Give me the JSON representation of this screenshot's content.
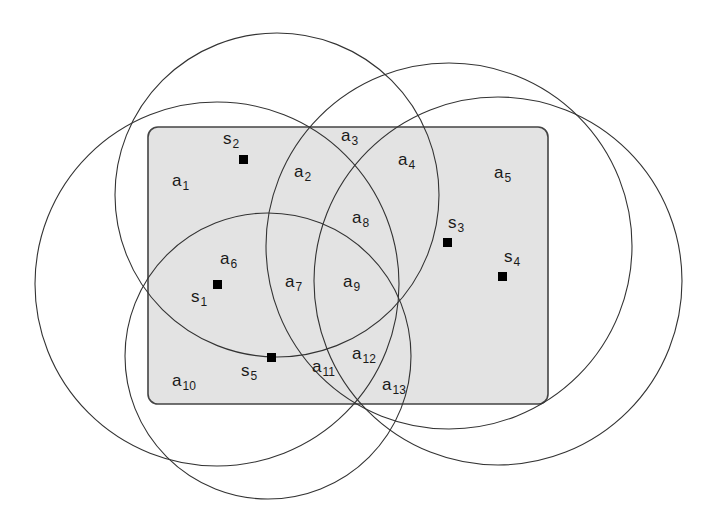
{
  "diagram": {
    "type": "sensor-coverage-venn",
    "colors": {
      "region_fill": "#e3e3e3",
      "region_border": "#444444",
      "circle_stroke": "#333333",
      "sensor_fill": "#000000",
      "label_text": "#1a1a1a"
    },
    "region": {
      "x": 148,
      "y": 127,
      "width": 400,
      "height": 277,
      "radius": 10
    },
    "circles": [
      {
        "id": "c1",
        "cx": 217,
        "cy": 284,
        "r": 182
      },
      {
        "id": "c2",
        "cx": 277,
        "cy": 195,
        "r": 162
      },
      {
        "id": "c3",
        "cx": 449,
        "cy": 246,
        "r": 183
      },
      {
        "id": "c4",
        "cx": 498,
        "cy": 281,
        "r": 184
      },
      {
        "id": "c5",
        "cx": 268,
        "cy": 356,
        "r": 143
      }
    ],
    "sensors": [
      {
        "id": "s1",
        "base": "s",
        "sub": "1",
        "x": 217,
        "y": 284,
        "label_x": 191,
        "label_y": 288
      },
      {
        "id": "s2",
        "base": "s",
        "sub": "2",
        "x": 243,
        "y": 159,
        "label_x": 223,
        "label_y": 130
      },
      {
        "id": "s3",
        "base": "s",
        "sub": "3",
        "x": 447,
        "y": 242,
        "label_x": 448,
        "label_y": 214
      },
      {
        "id": "s4",
        "base": "s",
        "sub": "4",
        "x": 502,
        "y": 276,
        "label_x": 504,
        "label_y": 248
      },
      {
        "id": "s5",
        "base": "s",
        "sub": "5",
        "x": 271,
        "y": 357,
        "label_x": 241,
        "label_y": 362
      }
    ],
    "areas": [
      {
        "id": "a1",
        "base": "a",
        "sub": "1",
        "x": 172,
        "y": 172
      },
      {
        "id": "a2",
        "base": "a",
        "sub": "2",
        "x": 294,
        "y": 163
      },
      {
        "id": "a3",
        "base": "a",
        "sub": "3",
        "x": 341,
        "y": 127
      },
      {
        "id": "a4",
        "base": "a",
        "sub": "4",
        "x": 398,
        "y": 151
      },
      {
        "id": "a5",
        "base": "a",
        "sub": "5",
        "x": 494,
        "y": 164
      },
      {
        "id": "a6",
        "base": "a",
        "sub": "6",
        "x": 220,
        "y": 250
      },
      {
        "id": "a7",
        "base": "a",
        "sub": "7",
        "x": 285,
        "y": 273
      },
      {
        "id": "a8",
        "base": "a",
        "sub": "8",
        "x": 352,
        "y": 209
      },
      {
        "id": "a9",
        "base": "a",
        "sub": "9",
        "x": 343,
        "y": 273
      },
      {
        "id": "a10",
        "base": "a",
        "sub": "10",
        "x": 172,
        "y": 372
      },
      {
        "id": "a11",
        "base": "a",
        "sub": "11",
        "x": 312,
        "y": 358
      },
      {
        "id": "a12",
        "base": "a",
        "sub": "12",
        "x": 352,
        "y": 345
      },
      {
        "id": "a13",
        "base": "a",
        "sub": "13",
        "x": 382,
        "y": 376
      }
    ]
  }
}
